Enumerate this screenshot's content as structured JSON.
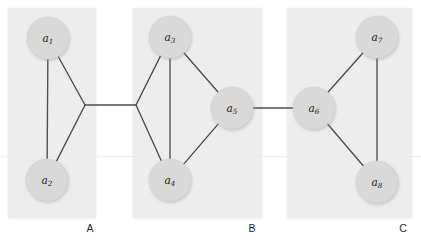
{
  "figure": {
    "type": "graph-diagram",
    "background_color": "#ffffff",
    "panel_color": "#ededed",
    "node_color": "#d9d9d9",
    "edge_color": "#4c4c4c",
    "label_color": "#1a1a1a"
  },
  "groups": [
    {
      "id": "A",
      "label": "A",
      "label_x": 90,
      "label_y": 229,
      "rect": {
        "x": 8,
        "y": 8,
        "width": 88,
        "height": 210
      },
      "junction": {
        "x": 85,
        "y": 105
      }
    },
    {
      "id": "B",
      "label": "B",
      "label_x": 252,
      "label_y": 229,
      "rect": {
        "x": 133,
        "y": 8,
        "width": 129,
        "height": 210
      },
      "junction": {
        "x": 136,
        "y": 105
      }
    },
    {
      "id": "C",
      "label": "C",
      "label_x": 403,
      "label_y": 229,
      "rect": {
        "x": 287,
        "y": 8,
        "width": 125,
        "height": 210
      },
      "junction": null
    }
  ],
  "nodes": [
    {
      "id": "a1",
      "base": "a",
      "sub": "1",
      "group": "A",
      "cx": 48,
      "cy": 38,
      "r": 21
    },
    {
      "id": "a2",
      "base": "a",
      "sub": "2",
      "group": "A",
      "cx": 47,
      "cy": 180,
      "r": 21
    },
    {
      "id": "a3",
      "base": "a",
      "sub": "3",
      "group": "B",
      "cx": 170,
      "cy": 37,
      "r": 21
    },
    {
      "id": "a4",
      "base": "a",
      "sub": "4",
      "group": "B",
      "cx": 170,
      "cy": 180,
      "r": 21
    },
    {
      "id": "a5",
      "base": "a",
      "sub": "5",
      "group": "B",
      "cx": 232,
      "cy": 108,
      "r": 21
    },
    {
      "id": "a6",
      "base": "a",
      "sub": "6",
      "group": "C",
      "cx": 314,
      "cy": 108,
      "r": 21
    },
    {
      "id": "a7",
      "base": "a",
      "sub": "7",
      "group": "C",
      "cx": 377,
      "cy": 37,
      "r": 21
    },
    {
      "id": "a8",
      "base": "a",
      "sub": "8",
      "group": "C",
      "cx": 377,
      "cy": 182,
      "r": 21
    }
  ],
  "edges": [
    {
      "from": "a1",
      "to": "a2",
      "kind": "intra"
    },
    {
      "from": "a1",
      "to": "junction-A",
      "kind": "intra"
    },
    {
      "from": "a2",
      "to": "junction-A",
      "kind": "intra"
    },
    {
      "from": "a3",
      "to": "a4",
      "kind": "intra"
    },
    {
      "from": "a3",
      "to": "a5",
      "kind": "intra"
    },
    {
      "from": "a4",
      "to": "a5",
      "kind": "intra"
    },
    {
      "from": "a3",
      "to": "junction-B",
      "kind": "intra"
    },
    {
      "from": "a4",
      "to": "junction-B",
      "kind": "intra"
    },
    {
      "from": "a6",
      "to": "a7",
      "kind": "intra"
    },
    {
      "from": "a6",
      "to": "a8",
      "kind": "intra"
    },
    {
      "from": "a7",
      "to": "a8",
      "kind": "intra"
    },
    {
      "from": "junction-A",
      "to": "junction-B",
      "kind": "inter"
    },
    {
      "from": "a5",
      "to": "a6",
      "kind": "inter"
    }
  ]
}
